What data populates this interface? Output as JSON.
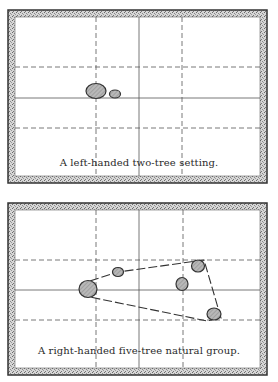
{
  "colors": {
    "frame_outline": "#333333",
    "frame_fill": "#bdbdbd",
    "grid_line": "#555555",
    "tree_fill": "#b8b8b8",
    "tree_outline": "#333333",
    "group_line": "#333333",
    "paper": "#ffffff"
  },
  "panels": [
    {
      "caption": "A left-handed two-tree setting.",
      "frame": {
        "x": 8,
        "y": 10,
        "w": 259,
        "h": 173
      },
      "grid": {
        "vertical": [
          {
            "x": 96,
            "style": "dashed"
          },
          {
            "x": 139,
            "style": "solid"
          },
          {
            "x": 182,
            "style": "dashed"
          }
        ],
        "horizontal": [
          {
            "y": 67,
            "style": "dashed"
          },
          {
            "y": 98,
            "style": "solid"
          },
          {
            "y": 128,
            "style": "dashed"
          }
        ]
      },
      "trees": [
        {
          "cx": 96,
          "cy": 91,
          "rx": 10,
          "ry": 7.5,
          "label": "large tree"
        },
        {
          "cx": 115,
          "cy": 94,
          "rx": 5.5,
          "ry": 4,
          "label": "small tree"
        }
      ],
      "group_outline": []
    },
    {
      "caption": "A right-handed five-tree natural group.",
      "frame": {
        "x": 8,
        "y": 203,
        "w": 259,
        "h": 172
      },
      "grid": {
        "vertical": [
          {
            "x": 96,
            "style": "dashed"
          },
          {
            "x": 139,
            "style": "solid"
          },
          {
            "x": 183,
            "style": "dashed"
          }
        ],
        "horizontal": [
          {
            "y": 260,
            "style": "dashed"
          },
          {
            "y": 290,
            "style": "solid"
          },
          {
            "y": 320,
            "style": "dashed"
          }
        ]
      },
      "trees": [
        {
          "cx": 88,
          "cy": 289,
          "rx": 9,
          "ry": 8.5,
          "label": "large tree"
        },
        {
          "cx": 118,
          "cy": 272,
          "rx": 5.5,
          "ry": 4.5,
          "label": "small tree"
        },
        {
          "cx": 198,
          "cy": 266,
          "rx": 6.5,
          "ry": 6,
          "label": "top-right tree"
        },
        {
          "cx": 182,
          "cy": 284,
          "rx": 6,
          "ry": 6.5,
          "label": "middle tree"
        },
        {
          "cx": 214,
          "cy": 314,
          "rx": 7,
          "ry": 6,
          "label": "bottom-right tree"
        }
      ],
      "group_outline": [
        [
          90,
          281
        ],
        [
          118,
          272
        ],
        [
          204,
          260
        ],
        [
          221,
          318
        ],
        [
          207,
          321
        ],
        [
          90,
          297
        ]
      ]
    }
  ]
}
